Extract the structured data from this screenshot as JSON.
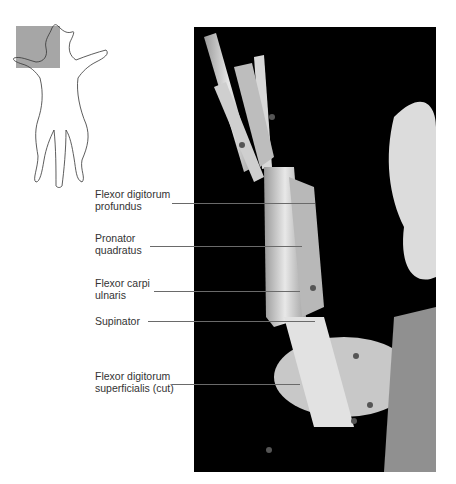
{
  "figure": {
    "orientation_icon": "cat-outline-with-highlighted-left-forelimb",
    "highlight_color": "#a6a6a6",
    "photo_background": "#000000"
  },
  "labels": [
    {
      "text": "Flexor digitorum\nprofundus",
      "y": 203
    },
    {
      "text": "Pronator\nquadratus",
      "y": 246
    },
    {
      "text": "Flexor carpi\nulnaris",
      "y": 291
    },
    {
      "text": "Supinator",
      "y": 321
    },
    {
      "text": "Flexor digitorum\nsuperficialis (cut)",
      "y": 384
    }
  ]
}
